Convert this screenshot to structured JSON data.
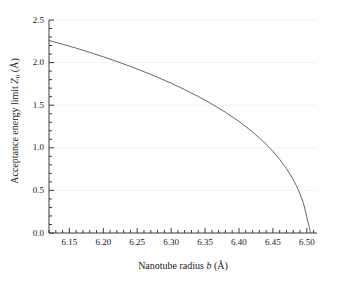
{
  "figure": {
    "background_color": "#ffffff",
    "axis_color": "#3a3a3a",
    "grid_color": "#f2f2f2",
    "curve_color": "#555555"
  },
  "axis_labels": {
    "x_prefix": "Nanotube radius ",
    "x_symbol": "b",
    "x_unit": " (Å)",
    "y_prefix": "Acceptance energy limit ",
    "y_symbol": "Z",
    "y_symbol_sub": "0",
    "y_unit": " (Å)"
  },
  "chart_data": {
    "type": "line",
    "title": "",
    "xlabel": "Nanotube radius b (Å)",
    "ylabel": "Acceptance energy limit Z0 (Å)",
    "xlim": [
      6.12,
      6.515
    ],
    "ylim": [
      0.0,
      2.5
    ],
    "grid": true,
    "grid_axis": "y",
    "legend": false,
    "xticks": [
      6.15,
      6.2,
      6.25,
      6.3,
      6.35,
      6.4,
      6.45,
      6.5
    ],
    "xtick_labels": [
      "6.15",
      "6.20",
      "6.25",
      "6.30",
      "6.35",
      "6.40",
      "6.45",
      "6.50"
    ],
    "x_minor_tick_step": 0.01,
    "yticks": [
      0.0,
      0.5,
      1.0,
      1.5,
      2.0,
      2.5
    ],
    "ytick_labels": [
      "0.0",
      "0.5",
      "1.0",
      "1.5",
      "2.0",
      "2.5"
    ],
    "y_minor_tick_step": 0.1,
    "series": [
      {
        "name": "Acceptance energy limit",
        "x": [
          6.12,
          6.14,
          6.16,
          6.18,
          6.2,
          6.22,
          6.24,
          6.26,
          6.28,
          6.3,
          6.32,
          6.34,
          6.36,
          6.38,
          6.4,
          6.42,
          6.44,
          6.45,
          6.46,
          6.47,
          6.48,
          6.485,
          6.49,
          6.495,
          6.5,
          6.502,
          6.504,
          6.505,
          6.506
        ],
        "y": [
          2.26,
          2.215,
          2.17,
          2.12,
          2.068,
          2.013,
          1.955,
          1.893,
          1.828,
          1.758,
          1.683,
          1.602,
          1.514,
          1.418,
          1.31,
          1.187,
          1.042,
          0.958,
          0.864,
          0.756,
          0.626,
          0.549,
          0.459,
          0.35,
          0.19,
          0.12,
          0.055,
          0.02,
          0.0
        ]
      }
    ]
  }
}
